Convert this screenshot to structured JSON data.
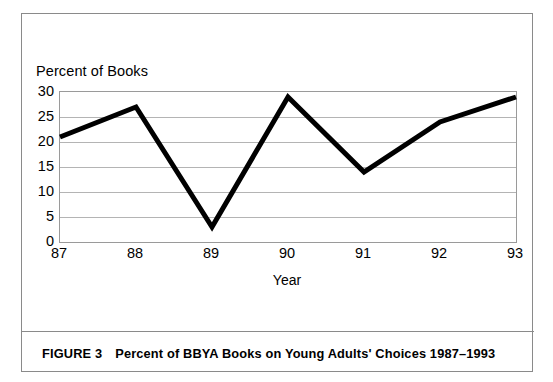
{
  "figure": {
    "caption_label": "FIGURE 3",
    "caption_text": "Percent of BBYA Books on Young Adults' Choices 1987–1993",
    "border_color": "#8a8a8a"
  },
  "chart_data": {
    "type": "line",
    "title": "",
    "subtitle": "",
    "xlabel": "Year",
    "ylabel": "Percent of Books",
    "categories": [
      "87",
      "88",
      "89",
      "90",
      "91",
      "92",
      "93"
    ],
    "x": [
      1987,
      1988,
      1989,
      1990,
      1991,
      1992,
      1993
    ],
    "values": [
      21,
      27,
      3,
      29,
      14,
      24,
      29
    ],
    "series": [
      {
        "name": "Percent of BBYA Books",
        "values": [
          21,
          27,
          3,
          29,
          14,
          24,
          29
        ],
        "color": "#000000",
        "line_width": 5
      }
    ],
    "ylim": [
      0,
      30
    ],
    "yticks": [
      0,
      5,
      10,
      15,
      20,
      25,
      30
    ],
    "ytick_labels": [
      "0",
      "5",
      "10",
      "15",
      "20",
      "25",
      "30"
    ],
    "xtick_labels": [
      "87",
      "88",
      "89",
      "90",
      "91",
      "92",
      "93"
    ],
    "grid": true,
    "grid_axis": "y",
    "grid_color": "#b4b4b4",
    "legend": false,
    "legend_position": "none",
    "plot_border_color": "#9a9a9a",
    "background": "#ffffff"
  }
}
